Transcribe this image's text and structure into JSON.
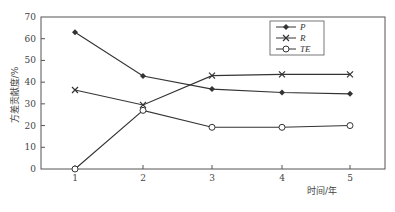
{
  "chart_data": {
    "type": "line",
    "title": "",
    "xlabel": "时间/年",
    "ylabel": "方差贡献度/%",
    "x": [
      1,
      2,
      3,
      4,
      5
    ],
    "xticks": [
      "1",
      "2",
      "3",
      "4",
      "5"
    ],
    "yticks": [
      "0",
      "10",
      "20",
      "30",
      "40",
      "50",
      "60",
      "70"
    ],
    "ylim": [
      0,
      70
    ],
    "grid": false,
    "legend_position": "upper right (inside)",
    "series": [
      {
        "name": "P",
        "marker": "filled-diamond",
        "values": [
          63,
          42.8,
          36.8,
          35.2,
          34.6
        ]
      },
      {
        "name": "R",
        "marker": "x",
        "values": [
          36.4,
          29.5,
          43,
          43.6,
          43.6
        ]
      },
      {
        "name": "TE",
        "marker": "open-circle",
        "values": [
          0,
          27,
          19.2,
          19.2,
          20
        ]
      }
    ]
  },
  "legend": {
    "items": [
      {
        "label": "P"
      },
      {
        "label": "R"
      },
      {
        "label": "TE"
      }
    ]
  },
  "colors": {
    "line": "#333333",
    "axis": "#555555",
    "background": "#ffffff"
  }
}
